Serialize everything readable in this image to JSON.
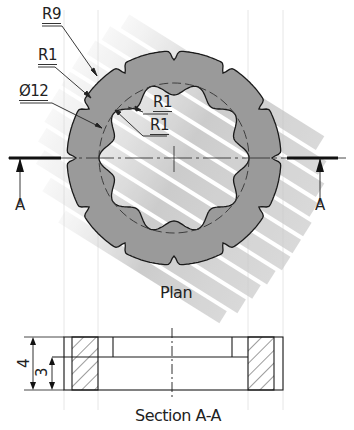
{
  "plan_view": {
    "caption": "Plan",
    "labels": {
      "outer_radius": "R9",
      "outer_notch_radius": "R1",
      "pitch_diameter": "Ø12",
      "inner_lobe_radius_1": "R1",
      "inner_lobe_radius_2": "R1"
    },
    "section_markers": {
      "left": "A",
      "right": "A"
    },
    "geometry": {
      "outer_notches": 12,
      "inner_lobes": 10
    }
  },
  "section_view": {
    "caption": "Section A-A",
    "dimensions": {
      "overall_height": "4",
      "lower_height": "3"
    }
  },
  "colors": {
    "part_fill": "#9a9a9a",
    "inner_fill": "#b4b4b4",
    "shadow_streaks": "#c2c2c2",
    "outline": "#1a1a1a",
    "background": "#ffffff"
  }
}
